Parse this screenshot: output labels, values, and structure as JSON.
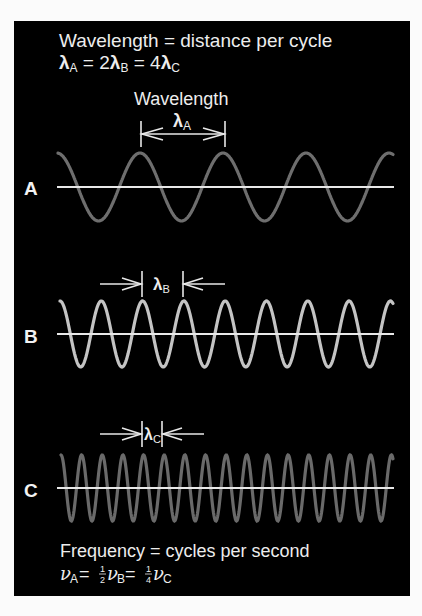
{
  "header": {
    "title": "Wavelength = distance per cycle",
    "relation": {
      "lambda": "λ",
      "eq1": " = 2",
      "eq2": " = 4",
      "subA": "A",
      "subB": "B",
      "subC": "C"
    }
  },
  "wavelength_caption": "Wavelength",
  "waves": [
    {
      "id": "A",
      "label": "A",
      "symbol": "λ",
      "sub": "A",
      "color": "#6e6e6e",
      "baseline_y": 187,
      "amplitude": 34,
      "period": 83,
      "peak_x": 140,
      "x_start": 58,
      "x_end": 393,
      "marker_left": 141,
      "marker_right": 225,
      "marker_y": 134
    },
    {
      "id": "B",
      "label": "B",
      "symbol": "λ",
      "sub": "B",
      "color": "#c4c4c4",
      "baseline_y": 334,
      "amplitude": 33,
      "period": 41.3,
      "peak_x": 60,
      "x_start": 60,
      "x_end": 393,
      "marker_left": 142,
      "marker_right": 183,
      "marker_y": 284
    },
    {
      "id": "C",
      "label": "C",
      "symbol": "λ",
      "sub": "C",
      "color": "#6a6a6a",
      "baseline_y": 488,
      "amplitude": 33,
      "period": 20.65,
      "peak_x": 61,
      "x_start": 61,
      "x_end": 393,
      "marker_left": 142,
      "marker_right": 162,
      "marker_y": 434
    }
  ],
  "footer": {
    "title": "Frequency = cycles per second",
    "relation": {
      "nu": "ν",
      "subA": "A",
      "subB": "B",
      "subC": "C",
      "eq": " = ",
      "half_num": "1",
      "half_den": "2",
      "quarter_num": "1",
      "quarter_den": "4"
    }
  },
  "colors": {
    "background": "#000000",
    "axis": "#e8e8e8",
    "text": "#ededed"
  }
}
